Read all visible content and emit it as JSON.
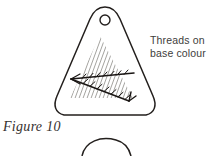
{
  "figure": {
    "caption": "Figure 10",
    "annotation": {
      "line1": "Threads on",
      "line2": "base colour"
    },
    "colors": {
      "outline": "#231f1d",
      "hatching": "#9a9894",
      "thread": "#1a1614",
      "text": "#403d3b",
      "caption": "#36312f",
      "background": "#ffffff"
    },
    "elements": {
      "pendant_shape": "rounded-triangle",
      "hole": "circle-at-apex",
      "hatch_fill": "diagonal-grey-lines",
      "thread_lines": "dark-arrowed-v-stitch",
      "partial_shape_below": "arc-top-of-next-figure"
    }
  }
}
